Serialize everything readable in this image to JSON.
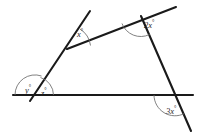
{
  "figure": {
    "background_color": "#ffffff",
    "line_color": "#1a1a1a",
    "arc_color": "#6a6a6a"
  },
  "labels": {
    "x": {
      "value": "x",
      "degree": "°"
    },
    "two_x": {
      "value": "2x",
      "degree": "°"
    },
    "y": {
      "value": "y",
      "degree": "°"
    },
    "z": {
      "value": "z",
      "degree": "°"
    },
    "three_x": {
      "value": "3x",
      "degree": "°"
    }
  },
  "geometry": {
    "baseline": {
      "x1": 13,
      "y1": 95,
      "x2": 193,
      "y2": 95
    },
    "left_transversal": {
      "x1": 30,
      "y1": 101,
      "x2": 90,
      "y2": 11
    },
    "upper_slant": {
      "x1": 68,
      "y1": 48,
      "x2": 176,
      "y2": 7
    },
    "right_transversal": {
      "x1": 141,
      "y1": 16,
      "x2": 191,
      "y2": 131
    }
  }
}
